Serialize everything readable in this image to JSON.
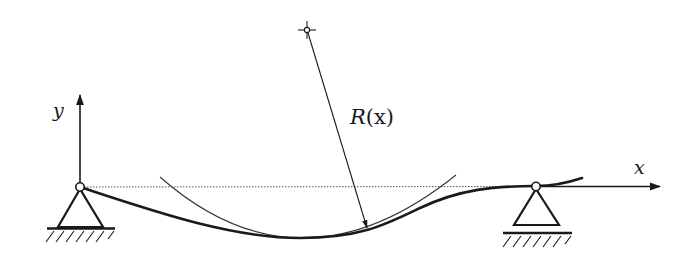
{
  "figure": {
    "labels": {
      "y_axis": "y",
      "x_axis": "x",
      "radius_symbol": "R",
      "radius_arg": "(x)"
    },
    "elements": {
      "supports": [
        "pin-support-left",
        "pin-support-right"
      ],
      "axes": [
        "x-axis",
        "y-axis"
      ],
      "reference_line": "undeformed-beam-axis (dotted)",
      "beam": "deflected-beam-curve",
      "osculating_circle": "curvature-circle-arc",
      "center_of_curvature": "center-point",
      "radius_arrow": "radius-of-curvature-arrow"
    },
    "colors": {
      "ink": "#1a1a1a",
      "thin_line": "#3a3a3a",
      "dotted_line": "#555555",
      "background": "#ffffff"
    }
  }
}
